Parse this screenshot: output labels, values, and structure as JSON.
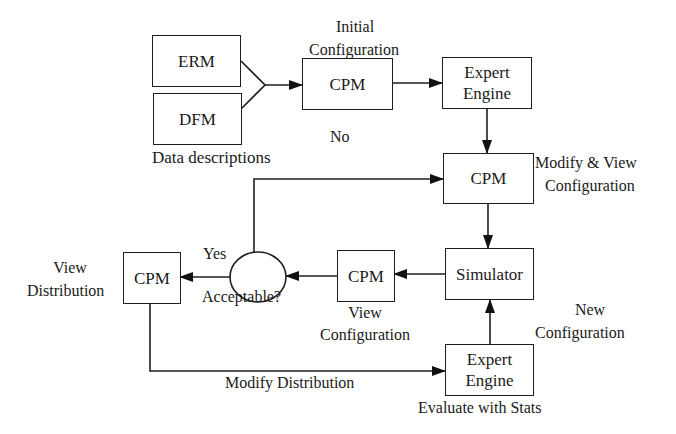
{
  "diagram": {
    "nodes": {
      "erm": {
        "label": "ERM"
      },
      "dfm": {
        "label": "DFM"
      },
      "cpm_initial": {
        "label": "CPM"
      },
      "expert_engine_top": {
        "line1": "Expert",
        "line2": "Engine"
      },
      "cpm_modify": {
        "label": "CPM"
      },
      "simulator": {
        "label": "Simulator"
      },
      "cpm_view_config": {
        "label": "CPM"
      },
      "decision": {
        "label": "Acceptable?"
      },
      "cpm_view_dist": {
        "label": "CPM"
      },
      "expert_engine_bottom": {
        "line1": "Expert",
        "line2": "Engine"
      }
    },
    "labels": {
      "data_descriptions": "Data descriptions",
      "initial_config_1": "Initial",
      "initial_config_2": "Configuration",
      "modify_view_1": "Modify & View",
      "modify_view_2": "Configuration",
      "no": "No",
      "yes": "Yes",
      "view_config_1": "View",
      "view_config_2": "Configuration",
      "view_dist_1": "View",
      "view_dist_2": "Distribution",
      "new_config_1": "New",
      "new_config_2": "Configuration",
      "modify_distribution": "Modify Distribution",
      "evaluate_stats": "Evaluate with Stats"
    },
    "edges": [
      {
        "from": "erm",
        "to": "cpm_initial"
      },
      {
        "from": "dfm",
        "to": "cpm_initial"
      },
      {
        "from": "cpm_initial",
        "to": "expert_engine_top"
      },
      {
        "from": "expert_engine_top",
        "to": "cpm_modify"
      },
      {
        "from": "cpm_modify",
        "to": "simulator"
      },
      {
        "from": "simulator",
        "to": "cpm_view_config"
      },
      {
        "from": "cpm_view_config",
        "to": "decision"
      },
      {
        "from": "decision",
        "to": "cpm_modify",
        "label": "No"
      },
      {
        "from": "decision",
        "to": "cpm_view_dist",
        "label": "Yes"
      },
      {
        "from": "cpm_view_dist",
        "to": "expert_engine_bottom",
        "label": "Modify Distribution"
      },
      {
        "from": "expert_engine_bottom",
        "to": "simulator",
        "label": "New Configuration"
      }
    ]
  }
}
